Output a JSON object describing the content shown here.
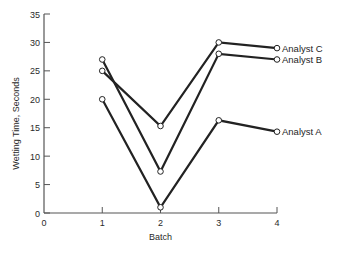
{
  "chart_data": {
    "type": "line",
    "title": "",
    "xlabel": "Batch",
    "ylabel": "Wetting Time, Seconds",
    "x": [
      1,
      2,
      3,
      4
    ],
    "x_ticks": [
      0,
      1,
      2,
      3,
      4
    ],
    "x_tick_labels": [
      "0",
      "1",
      "2",
      "3",
      "4"
    ],
    "y_ticks": [
      0,
      5,
      10,
      15,
      20,
      25,
      30,
      35
    ],
    "y_tick_labels": [
      "0",
      "5",
      "10",
      "15",
      "20",
      "25",
      "30",
      "35"
    ],
    "xlim": [
      0,
      4
    ],
    "ylim": [
      0,
      35
    ],
    "grid": false,
    "legend_position": "inline-right",
    "marker": "open-circle",
    "series": [
      {
        "name": "Analyst A",
        "values": [
          20,
          1,
          16.3,
          14.3
        ]
      },
      {
        "name": "Analyst B",
        "values": [
          27,
          7.3,
          28,
          27
        ]
      },
      {
        "name": "Analyst C",
        "values": [
          25,
          15.3,
          30,
          29
        ]
      }
    ]
  },
  "colors": {
    "line": "#222222",
    "axis": "#555555",
    "background": "#ffffff"
  }
}
